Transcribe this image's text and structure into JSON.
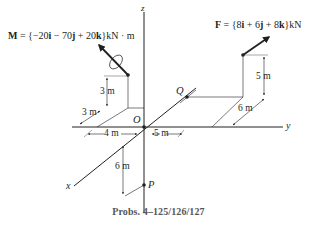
{
  "figure": {
    "moment_label": {
      "symbol": "M",
      "eq": " = {−20",
      "i": "i",
      "m1": " − 70",
      "j": "j",
      "m2": " + 20",
      "k": "k",
      "unit": "}kN · m"
    },
    "force_label": {
      "symbol": "F",
      "eq": " = {8",
      "i": "i",
      "m1": " + 6",
      "j": "j",
      "m2": " + 8",
      "k": "k",
      "unit": "}kN"
    },
    "axes": {
      "x": "x",
      "y": "y",
      "z": "z"
    },
    "points": {
      "origin": "O",
      "Q": "Q",
      "P": "P"
    },
    "dimensions": {
      "m_height": "3 m",
      "m_x_offset": "3 m",
      "m_y_offset": "4 m",
      "f_y_offset": "5 m",
      "f_height": "5 m",
      "f_x_offset": "6 m",
      "p_depth": "6 m"
    },
    "caption": "Probs. 4–125/126/127"
  }
}
